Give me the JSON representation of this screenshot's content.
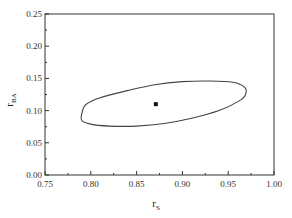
{
  "chart_data": {
    "type": "line",
    "title": "",
    "xlabel": "r_S",
    "xlabel_main": "r",
    "xlabel_sub": "S",
    "ylabel": "r_BA",
    "ylabel_main": "r",
    "ylabel_sub": "BA",
    "xlim": [
      0.75,
      1.0
    ],
    "ylim": [
      0.0,
      0.25
    ],
    "xticks": [
      "0.75",
      "0.80",
      "0.85",
      "0.90",
      "0.95",
      "1.00"
    ],
    "yticks": [
      "0.00",
      "0.05",
      "0.10",
      "0.15",
      "0.20",
      "0.25"
    ],
    "grid": false,
    "legend": null,
    "series": [
      {
        "name": "confidence region contour",
        "kind": "closed-curve",
        "points": [
          [
            0.79,
            0.085
          ],
          [
            0.791,
            0.1
          ],
          [
            0.795,
            0.11
          ],
          [
            0.81,
            0.12
          ],
          [
            0.84,
            0.131
          ],
          [
            0.87,
            0.14
          ],
          [
            0.9,
            0.145
          ],
          [
            0.93,
            0.146
          ],
          [
            0.955,
            0.144
          ],
          [
            0.968,
            0.136
          ],
          [
            0.969,
            0.125
          ],
          [
            0.962,
            0.115
          ],
          [
            0.94,
            0.1
          ],
          [
            0.91,
            0.088
          ],
          [
            0.88,
            0.08
          ],
          [
            0.85,
            0.076
          ],
          [
            0.82,
            0.076
          ],
          [
            0.8,
            0.079
          ],
          [
            0.79,
            0.085
          ]
        ]
      },
      {
        "name": "point estimate",
        "kind": "marker",
        "points": [
          [
            0.871,
            0.11
          ]
        ]
      }
    ]
  }
}
